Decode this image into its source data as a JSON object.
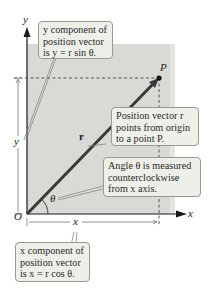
{
  "axes": {
    "x_label": "x",
    "y_label": "y",
    "origin_label": "O"
  },
  "vector": {
    "label": "r",
    "point_label": "P",
    "angle_label": "θ",
    "color": "#3a3a3a"
  },
  "components": {
    "x_span_label": "x",
    "y_span_label": "y"
  },
  "colors": {
    "shaded_region": "#d9d9d6",
    "callout_bg": "#eeefe9",
    "callout_border": "#9a9a8f"
  },
  "callouts": {
    "y_component": {
      "lines": [
        "y component of",
        "position vector",
        "is y = r sin θ."
      ]
    },
    "position_vector": {
      "lines": [
        "Position vector r",
        "points from origin",
        "to a point P."
      ]
    },
    "angle": {
      "lines": [
        "Angle θ is measured",
        "counterclockwise",
        "from x axis."
      ]
    },
    "x_component": {
      "lines": [
        "x component of",
        "position vector",
        "is x = r cos θ."
      ]
    }
  }
}
